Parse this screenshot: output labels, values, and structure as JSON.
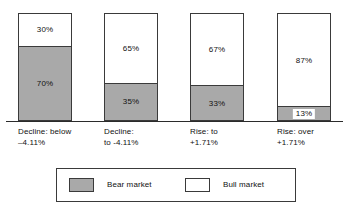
{
  "chart_data": {
    "type": "bar",
    "subtype": "stacked-percentage",
    "title": "",
    "subtitle": "",
    "xlabel": "",
    "ylabel": "",
    "ylim": [
      0,
      100
    ],
    "grid": false,
    "legend_position": "bottom",
    "categories": [
      "Decline: below\n–4.11%",
      "Decline:\nto -4.11%",
      "Rise: to\n+1.71%",
      "Rise: over\n+1.71%"
    ],
    "series": [
      {
        "name": "Bear market",
        "color": "#a9a9a9",
        "values": [
          70,
          35,
          33,
          13
        ],
        "labels": [
          "70%",
          "35%",
          "33%",
          "13%"
        ]
      },
      {
        "name": "Bull market",
        "color": "#ffffff",
        "values": [
          30,
          65,
          67,
          87
        ],
        "labels": [
          "30%",
          "65%",
          "67%",
          "87%"
        ]
      }
    ]
  },
  "bars": [
    {
      "category": "Decline: below\n–4.11%",
      "bull_label": "30%",
      "bear_label": "70%",
      "bull_pct": 30,
      "bear_pct": 70
    },
    {
      "category": "Decline:\nto -4.11%",
      "bull_label": "65%",
      "bear_label": "35%",
      "bull_pct": 65,
      "bear_pct": 35
    },
    {
      "category": "Rise: to\n+1.71%",
      "bull_label": "67%",
      "bear_label": "33%",
      "bull_pct": 67,
      "bear_pct": 33
    },
    {
      "category": "Rise: over\n+1.71%",
      "bull_label": "87%",
      "bear_label": "13%",
      "bull_pct": 87,
      "bear_pct": 13
    }
  ],
  "legend": {
    "entries": [
      {
        "label": "Bear market",
        "swatch": "bear-market-swatch",
        "color": "#a9a9a9"
      },
      {
        "label": "Bull market",
        "swatch": "bull-market-swatch",
        "color": "#ffffff"
      }
    ]
  },
  "colors": {
    "bear": "#a9a9a9",
    "bull": "#ffffff",
    "outline": "#3a3a3a",
    "text": "#111111",
    "background": "#ffffff"
  }
}
